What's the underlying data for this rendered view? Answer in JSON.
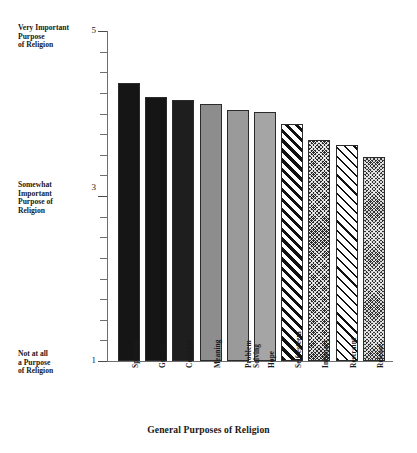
{
  "chart_data": {
    "type": "bar",
    "title": "",
    "xlabel": "General Purposes of Religion",
    "ylabel": "",
    "ylim": [
      1,
      5
    ],
    "grid": false,
    "legend": "none",
    "y_tick_labels": [
      "5",
      "3",
      "1"
    ],
    "y_axis_annotations": [
      "Very Important Purpose of Religion",
      "Somewhat Important Purpose of Religion",
      "Not at all a Purpose of Religion"
    ],
    "categories": [
      "Spiritual",
      "Growth",
      "Comfort",
      "Meaning",
      "Problem Solving",
      "Hope",
      "Self-esteem",
      "Intimacy",
      "Restraint",
      "Release"
    ],
    "values": [
      4.37,
      4.2,
      4.16,
      4.11,
      4.04,
      4.02,
      3.87,
      3.68,
      3.62,
      3.47
    ]
  },
  "axis": {
    "y_labels": [
      {
        "num": "5",
        "anno_line1": "Very Important",
        "anno_line2": "Purpose",
        "anno_line3": "of Religion"
      },
      {
        "num": "3",
        "anno_line1": "Somewhat",
        "anno_line2": "Important",
        "anno_line3": "Purpose of",
        "anno_line4": "Religion"
      },
      {
        "num": "1",
        "anno_line1": "Not at all",
        "anno_line2": "a Purpose",
        "anno_line3": "of Religion"
      }
    ],
    "x_title": "General Purposes of Religion"
  },
  "bars": [
    {
      "label": "Spiritual",
      "label2": "",
      "value": 4.37,
      "fill": "f-dark"
    },
    {
      "label": "Growth",
      "label2": "",
      "value": 4.2,
      "fill": "f-dark"
    },
    {
      "label": "Comfort",
      "label2": "",
      "value": 4.16,
      "fill": "f-dark2"
    },
    {
      "label": "Meaning",
      "label2": "",
      "value": 4.11,
      "fill": "f-gray"
    },
    {
      "label": "Problem",
      "label2": "Solving",
      "value": 4.04,
      "fill": "f-gray2"
    },
    {
      "label": "Hope",
      "label2": "",
      "value": 4.02,
      "fill": "f-gray3"
    },
    {
      "label": "Self-esteem",
      "label2": "",
      "value": 3.87,
      "fill": "f-diag-thick"
    },
    {
      "label": "Intimacy",
      "label2": "",
      "value": 3.68,
      "fill": "f-cross-dark"
    },
    {
      "label": "Restraint",
      "label2": "",
      "value": 3.62,
      "fill": "f-diag-thin"
    },
    {
      "label": "Release",
      "label2": "",
      "value": 3.47,
      "fill": "f-cross-dark2"
    }
  ]
}
